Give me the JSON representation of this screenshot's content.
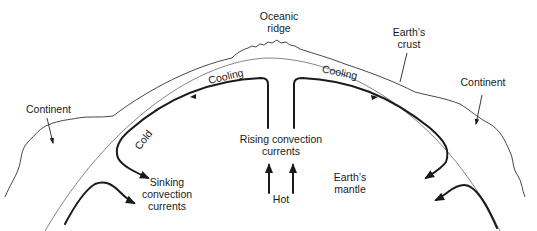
{
  "labels": {
    "oceanic_ridge": [
      "Oceanic",
      "ridge"
    ],
    "earths_crust": [
      "Earth’s",
      "crust"
    ],
    "continent_left": "Continent",
    "continent_right": "Continent",
    "cooling_left": "Cooling",
    "cooling_right": "Cooling",
    "cold": "Cold",
    "rising": [
      "Rising convection",
      "currents"
    ],
    "sinking": [
      "Sinking",
      "convection",
      "currents"
    ],
    "hot": "Hot",
    "mantle": [
      "Earth’s",
      "mantle"
    ]
  },
  "colors": {
    "line": "#1a1a1a",
    "crust_line": "#777777",
    "background": "#ffffff"
  }
}
